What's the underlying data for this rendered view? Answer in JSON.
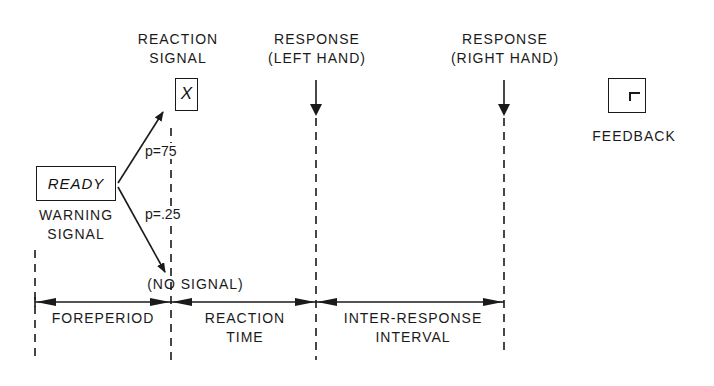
{
  "labels": {
    "reaction_signal": [
      "REACTION",
      "SIGNAL"
    ],
    "response_left": [
      "RESPONSE",
      "(LEFT HAND)"
    ],
    "response_right": [
      "RESPONSE",
      "(RIGHT HAND)"
    ],
    "feedback": "FEEDBACK",
    "warning_signal": [
      "WARNING",
      "SIGNAL"
    ],
    "no_signal": "(NO SIGNAL)"
  },
  "boxes": {
    "ready": "READY",
    "reaction_symbol": "X",
    "feedback_symbol": "⌜"
  },
  "branches": {
    "upper_probability": "p=75",
    "lower_probability": "p=.25"
  },
  "intervals": {
    "foreperiod": "FOREPERIOD",
    "reaction_time": [
      "REACTION",
      "TIME"
    ],
    "inter_response": [
      "INTER-RESPONSE",
      "INTERVAL"
    ]
  },
  "colors": {
    "ink": "#1a1a1a",
    "background": "#ffffff"
  }
}
